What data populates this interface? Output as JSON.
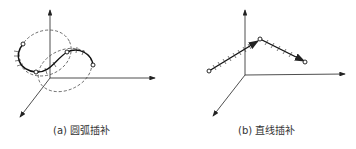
{
  "figures": [
    {
      "id": "a",
      "caption": "(a) 圆弧插补",
      "topic": "circular interpolation"
    },
    {
      "id": "b",
      "caption": "(b) 直线插补",
      "topic": "linear interpolation"
    }
  ]
}
